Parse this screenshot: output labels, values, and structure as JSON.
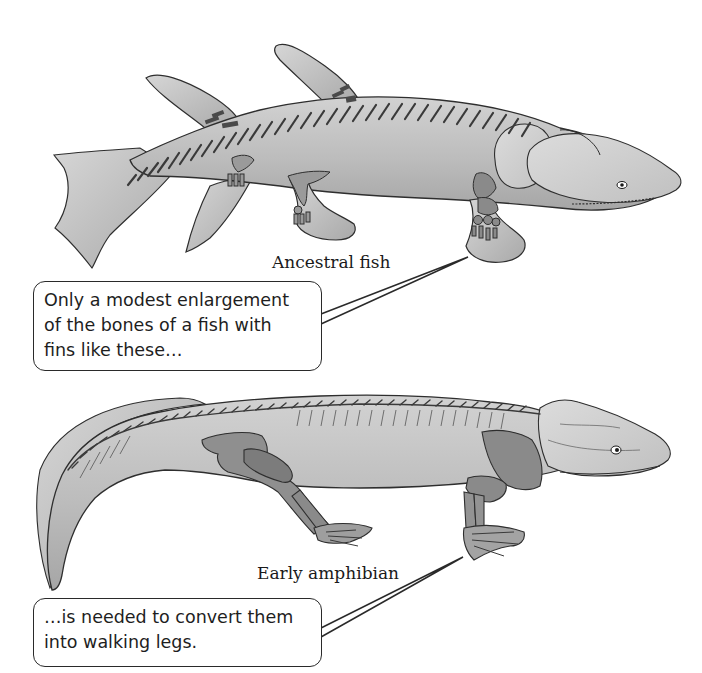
{
  "figure": {
    "panels": [
      {
        "id": "fish",
        "label": "Ancestral fish",
        "callout_lines": [
          "Only a modest enlargement",
          "of the bones of a fish with",
          "fins like these…"
        ]
      },
      {
        "id": "amphibian",
        "label": "Early amphibian",
        "callout_lines": [
          "…is needed to convert them",
          "into walking legs."
        ]
      }
    ]
  },
  "colors": {
    "background": "#ffffff",
    "body_fill": "#c9c9c9",
    "body_shade": "#a9a9a9",
    "bone_fill": "#8a8a8a",
    "outline": "#2e2e2e",
    "text": "#1a1a1a"
  }
}
